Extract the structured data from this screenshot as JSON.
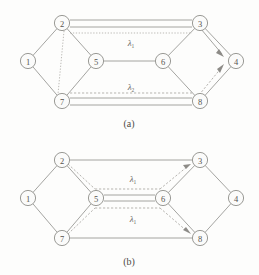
{
  "figure": {
    "background_color": "#fdfdfc",
    "line_color": "#9a9a96",
    "node_fill": "#fbfbfa",
    "node_stroke": "#8e8e8a"
  },
  "diagrams": [
    {
      "id": "a",
      "caption": "(a)",
      "nodes": [
        {
          "id": "1",
          "label": "1",
          "x": 28,
          "y": 61
        },
        {
          "id": "2",
          "label": "2",
          "x": 62,
          "y": 23
        },
        {
          "id": "3",
          "label": "3",
          "x": 200,
          "y": 23
        },
        {
          "id": "4",
          "label": "4",
          "x": 236,
          "y": 61
        },
        {
          "id": "5",
          "label": "5",
          "x": 96,
          "y": 61
        },
        {
          "id": "6",
          "label": "6",
          "x": 163,
          "y": 61
        },
        {
          "id": "7",
          "label": "7",
          "x": 62,
          "y": 101
        },
        {
          "id": "8",
          "label": "8",
          "x": 200,
          "y": 101
        }
      ],
      "labels": [
        {
          "id": "lambda-1",
          "base": "λ",
          "sub": "1",
          "x": 131,
          "y": 43
        },
        {
          "id": "lambda-2",
          "base": "λ",
          "sub": "2",
          "x": 131,
          "y": 88
        }
      ]
    },
    {
      "id": "b",
      "caption": "(b)",
      "nodes": [
        {
          "id": "1",
          "label": "1",
          "x": 28,
          "y": 61
        },
        {
          "id": "2",
          "label": "2",
          "x": 62,
          "y": 23
        },
        {
          "id": "3",
          "label": "3",
          "x": 200,
          "y": 23
        },
        {
          "id": "4",
          "label": "4",
          "x": 236,
          "y": 61
        },
        {
          "id": "5",
          "label": "5",
          "x": 96,
          "y": 61
        },
        {
          "id": "6",
          "label": "6",
          "x": 163,
          "y": 61
        },
        {
          "id": "7",
          "label": "7",
          "x": 62,
          "y": 101
        },
        {
          "id": "8",
          "label": "8",
          "x": 200,
          "y": 101
        }
      ],
      "labels": [
        {
          "id": "lambda-1-upper",
          "base": "λ",
          "sub": "1",
          "x": 133,
          "y": 45
        },
        {
          "id": "lambda-1-lower",
          "base": "λ",
          "sub": "1",
          "x": 133,
          "y": 83
        }
      ]
    }
  ]
}
